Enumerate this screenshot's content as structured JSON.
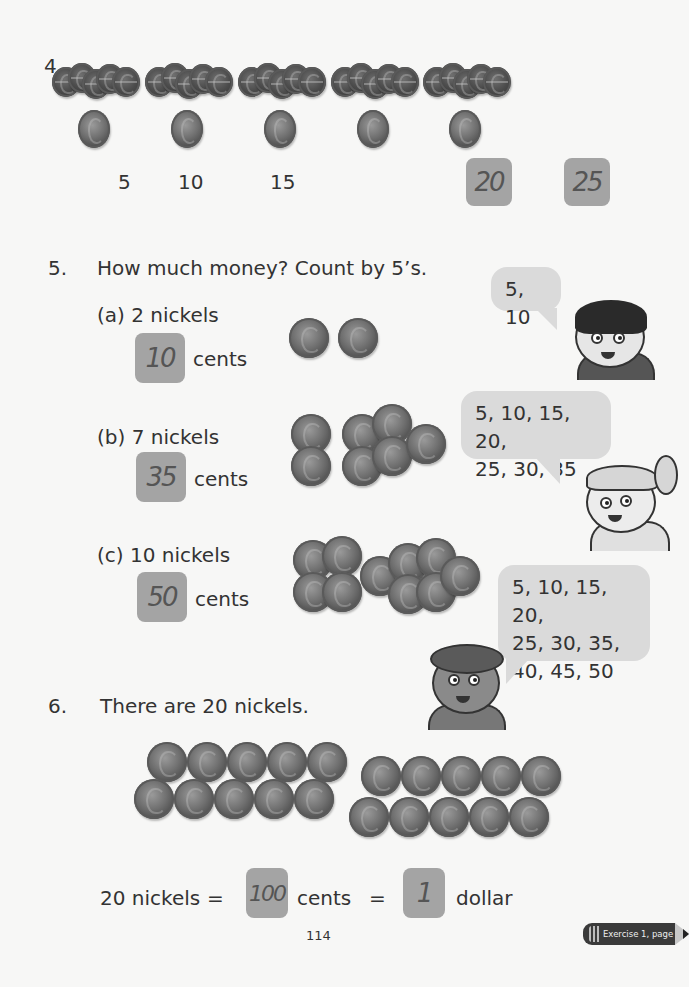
{
  "section4": {
    "number": "4.",
    "groups": [
      {
        "label": "5",
        "answer": false
      },
      {
        "label": "10",
        "answer": false
      },
      {
        "label": "15",
        "answer": false
      },
      {
        "label": "20",
        "answer": true
      },
      {
        "label": "25",
        "answer": true
      }
    ],
    "label_0": "5",
    "label_1": "10",
    "label_2": "15",
    "answer_3": "20",
    "answer_4": "25"
  },
  "section5": {
    "number": "5.",
    "prompt": "How much money? Count by 5’s.",
    "items": [
      {
        "label": "(a) 2 nickels",
        "answer": "10",
        "unit": "cents",
        "coin_count": 2
      },
      {
        "label": "(b) 7 nickels",
        "answer": "35",
        "unit": "cents",
        "coin_count": 7
      },
      {
        "label": "(c) 10 nickels",
        "answer": "50",
        "unit": "cents",
        "coin_count": 10
      }
    ],
    "bubbles": [
      {
        "line1": "5, 10"
      },
      {
        "line1": "5, 10, 15, 20,",
        "line2": "25, 30, 35"
      },
      {
        "line1": "5, 10, 15, 20,",
        "line2": "25, 30, 35,",
        "line3": "40, 45, 50"
      }
    ]
  },
  "section6": {
    "number": "6.",
    "prompt": "There are 20 nickels.",
    "equation": {
      "left": "20 nickels",
      "eq1": "=",
      "answer1": "100",
      "mid": "cents",
      "eq2": "=",
      "answer2": "1",
      "right": "dollar"
    }
  },
  "footer": {
    "page_number": "114",
    "exercise_ref": "Exercise 1, page 186"
  },
  "colors": {
    "answer_box": "#a4a4a4",
    "bubble": "#dadada",
    "text": "#333333",
    "background": "#f7f7f6"
  }
}
